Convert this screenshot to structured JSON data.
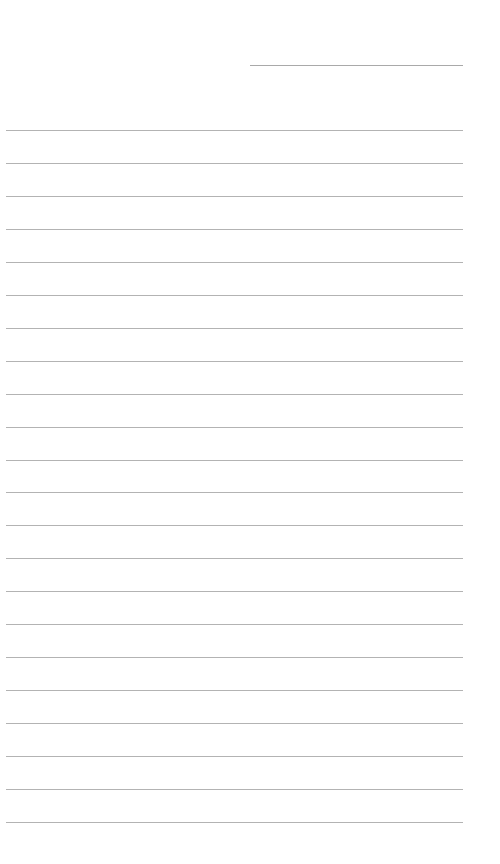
{
  "document": {
    "type": "lined-paper",
    "header_line": {
      "x": 250,
      "y": 65,
      "width": 213
    },
    "ruled_lines": {
      "count": 22,
      "start_y": 130,
      "spacing": 32.95,
      "left": 6,
      "width": 457
    },
    "colors": {
      "background": "#ffffff",
      "line": "#b3b3b3"
    }
  }
}
